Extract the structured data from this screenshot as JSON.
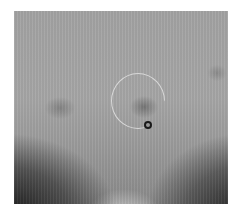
{
  "image": {
    "kind": "grayscale scan",
    "annotations": [
      {
        "type": "circle-outline",
        "color": "#d8d8d8"
      },
      {
        "type": "ring-marker",
        "color": "#1a1a1a"
      }
    ]
  }
}
